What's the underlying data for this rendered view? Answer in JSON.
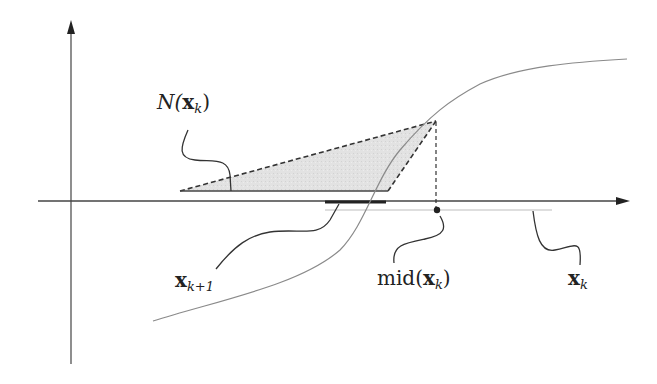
{
  "diagram": {
    "type": "interval-newton-step",
    "labels": {
      "newton_operator": {
        "prefix": "N(",
        "var": "x",
        "sub": "k",
        "suffix": ")"
      },
      "next_interval": {
        "var": "x",
        "sub": "k+1"
      },
      "midpoint": {
        "prefix": "mid(",
        "var": "x",
        "sub": "k",
        "suffix": ")"
      },
      "current_interval": {
        "var": "x",
        "sub": "k"
      }
    },
    "colors": {
      "axis": "#444444",
      "curve": "#8a8a8a",
      "triangle_fill": "#dcdcdc",
      "dashed": "#333333",
      "interval_bar": "#222222",
      "interval_light": "#bbbbbb",
      "leader": "#333333"
    },
    "elements": [
      "x-axis with arrow",
      "y-axis with arrow",
      "sigmoid-like function curve",
      "shaded triangle (Newton operator image)",
      "dashed vertical line from curve to midpoint",
      "midpoint dot",
      "thick segment x_{k+1}",
      "light segment x_k"
    ]
  }
}
